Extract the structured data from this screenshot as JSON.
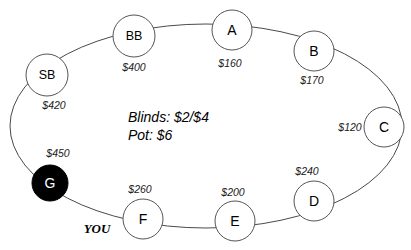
{
  "diagram": {
    "center_info": {
      "blinds_line": "Blinds: $2/$4",
      "pot_line": "Pot: $6"
    },
    "hero_marker": "YOU",
    "colors": {
      "ring_stroke": "#4a4a4a",
      "seat_stroke": "#555555",
      "seat_fill": "#ffffff",
      "hero_seat_fill": "#000000",
      "text": "#000000"
    },
    "seats": [
      {
        "id": "bb",
        "label": "BB",
        "stack": "$400",
        "cx": 134,
        "cy": 36,
        "r": 21,
        "filled": false,
        "label_size": "small",
        "stack_x": 134,
        "stack_y": 67
      },
      {
        "id": "a",
        "label": "A",
        "stack": "$160",
        "cx": 232,
        "cy": 30,
        "r": 20,
        "filled": false,
        "label_size": "normal",
        "stack_x": 230,
        "stack_y": 63
      },
      {
        "id": "b",
        "label": "B",
        "stack": "$170",
        "cx": 314,
        "cy": 51,
        "r": 20,
        "filled": false,
        "label_size": "normal",
        "stack_x": 312,
        "stack_y": 80
      },
      {
        "id": "c",
        "label": "C",
        "stack": "$120",
        "cx": 384,
        "cy": 127,
        "r": 20,
        "filled": false,
        "label_size": "normal",
        "stack_x": 350,
        "stack_y": 127
      },
      {
        "id": "d",
        "label": "D",
        "stack": "$240",
        "cx": 314,
        "cy": 201,
        "r": 20,
        "filled": false,
        "label_size": "normal",
        "stack_x": 307,
        "stack_y": 171
      },
      {
        "id": "e",
        "label": "E",
        "stack": "$200",
        "cx": 235,
        "cy": 221,
        "r": 20,
        "filled": false,
        "label_size": "normal",
        "stack_x": 233,
        "stack_y": 192
      },
      {
        "id": "f",
        "label": "F",
        "stack": "$260",
        "cx": 143,
        "cy": 219,
        "r": 20,
        "filled": false,
        "label_size": "normal",
        "stack_x": 140,
        "stack_y": 189
      },
      {
        "id": "g",
        "label": "G",
        "stack": "$450",
        "cx": 50,
        "cy": 183,
        "r": 18,
        "filled": true,
        "label_size": "normal",
        "stack_x": 58,
        "stack_y": 153
      },
      {
        "id": "sb",
        "label": "SB",
        "stack": "$420",
        "cx": 47,
        "cy": 75,
        "r": 21,
        "filled": false,
        "label_size": "small",
        "stack_x": 54,
        "stack_y": 105
      }
    ],
    "center_text_x": 128,
    "blinds_y": 117,
    "pot_y": 135,
    "you_x": 97,
    "you_y": 228
  }
}
